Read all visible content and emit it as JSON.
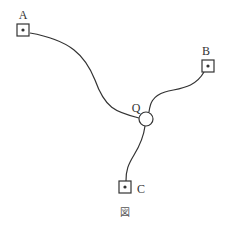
{
  "diagram": {
    "caption": "図",
    "nodes": [
      {
        "id": "A",
        "label": "A",
        "shape": "square-with-dot",
        "center": [
          23,
          30
        ],
        "label_pos": [
          23,
          16
        ]
      },
      {
        "id": "B",
        "label": "B",
        "shape": "square-with-dot",
        "center": [
          208,
          66
        ],
        "label_pos": [
          206,
          51
        ]
      },
      {
        "id": "C",
        "label": "C",
        "shape": "square-with-dot",
        "center": [
          125,
          187
        ],
        "label_pos": [
          142,
          192
        ]
      },
      {
        "id": "Q",
        "label": "Q",
        "shape": "circle",
        "center": [
          146,
          119
        ],
        "label_pos": [
          135,
          113
        ]
      }
    ],
    "edges": [
      {
        "from": "A",
        "to": "Q"
      },
      {
        "from": "B",
        "to": "Q"
      },
      {
        "from": "C",
        "to": "Q"
      }
    ],
    "colors": {
      "stroke": "#333333",
      "background": "#ffffff"
    }
  }
}
